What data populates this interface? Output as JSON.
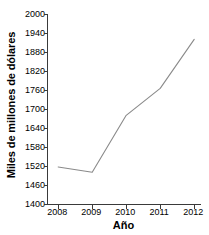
{
  "chart_data": {
    "type": "line",
    "title": "",
    "subtitle": "",
    "xlabel": "Año",
    "ylabel": "Miles de millones de dólares",
    "x": [
      2008,
      2009,
      2010,
      2011,
      2012
    ],
    "xtick_labels": [
      "2008",
      "2009",
      "2010",
      "2011",
      "2012"
    ],
    "values": [
      1517,
      1500,
      1680,
      1765,
      1920
    ],
    "series": [
      {
        "name": "Miles de millones de dólares",
        "values": [
          1517,
          1500,
          1680,
          1765,
          1920
        ]
      }
    ],
    "ylim": [
      1400,
      2000
    ],
    "xlim": [
      2007.7,
      2012.2
    ],
    "ytick_labels": [
      "1400",
      "1460",
      "1520",
      "1580",
      "1640",
      "1700",
      "1760",
      "1820",
      "1880",
      "1940",
      "2000"
    ],
    "yticks": [
      1400,
      1460,
      1520,
      1580,
      1640,
      1700,
      1760,
      1820,
      1880,
      1940,
      2000
    ],
    "ystep": 60,
    "grid": false,
    "legend": false,
    "legend_position": "none",
    "markers": false,
    "line_color": "#8a8a8a",
    "axis_color": "#3a3a3a",
    "background": "#ffffff",
    "annotations": []
  }
}
